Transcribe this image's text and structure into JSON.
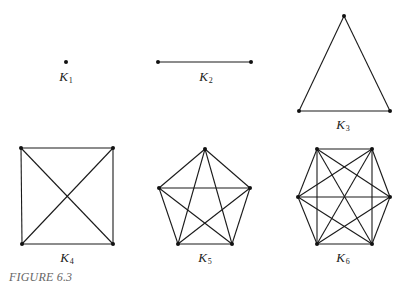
{
  "figure": {
    "caption": "FIGURE 6.3",
    "edge_color": "#1a1a1a",
    "vertex_color": "#111111"
  },
  "graphs": [
    {
      "name": "K1",
      "label_letter": "K",
      "label_sub": "1",
      "label_pos": [
        66,
        70
      ],
      "vertices": [
        [
          66,
          62
        ]
      ],
      "edges": "complete"
    },
    {
      "name": "K2",
      "label_letter": "K",
      "label_sub": "2",
      "label_pos": [
        206,
        70
      ],
      "vertices": [
        [
          158,
          62
        ],
        [
          251,
          62
        ]
      ],
      "edges": "complete"
    },
    {
      "name": "K3",
      "label_letter": "K",
      "label_sub": "3",
      "label_pos": [
        343,
        118
      ],
      "vertices": [
        [
          344,
          16
        ],
        [
          299,
          111
        ],
        [
          390,
          111
        ]
      ],
      "edges": "complete"
    },
    {
      "name": "K4",
      "label_letter": "K",
      "label_sub": "4",
      "label_pos": [
        67,
        251
      ],
      "vertices": [
        [
          21,
          148
        ],
        [
          113,
          148
        ],
        [
          113,
          244
        ],
        [
          22,
          244
        ]
      ],
      "edges": "complete"
    },
    {
      "name": "K5",
      "label_letter": "K",
      "label_sub": "5",
      "label_pos": [
        205,
        251
      ],
      "vertices": [
        [
          205,
          149
        ],
        [
          250,
          188
        ],
        [
          232,
          244
        ],
        [
          178,
          244
        ],
        [
          159,
          188
        ]
      ],
      "edges": "complete"
    },
    {
      "name": "K6",
      "label_letter": "K",
      "label_sub": "6",
      "label_pos": [
        343,
        251
      ],
      "vertices": [
        [
          317,
          149
        ],
        [
          372,
          149
        ],
        [
          390,
          197
        ],
        [
          372,
          244
        ],
        [
          317,
          244
        ],
        [
          298,
          197
        ]
      ],
      "edges": "complete"
    }
  ]
}
